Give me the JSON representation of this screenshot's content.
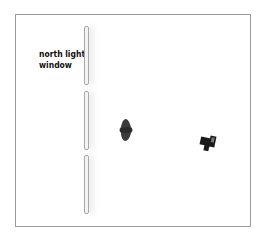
{
  "diagram": {
    "label": {
      "line1": "north light",
      "line2": "window"
    },
    "window_panes": [
      {
        "top": 26,
        "height": 57
      },
      {
        "top": 91,
        "height": 57
      },
      {
        "top": 155,
        "height": 57
      }
    ],
    "objects": [
      "subject-light",
      "camera"
    ],
    "colors": {
      "frame": "#9a9a9a",
      "objects": "#1a1a1a",
      "subject": "#3a3a3a"
    }
  }
}
